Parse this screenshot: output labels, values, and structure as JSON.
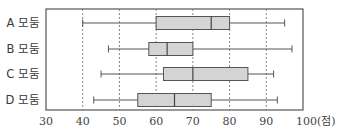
{
  "chart_data": {
    "type": "boxplot",
    "title": "",
    "xlabel": "",
    "ylabel": "",
    "unit_label": "(점)",
    "xlim": [
      30,
      100
    ],
    "x_ticks": [
      30,
      40,
      50,
      60,
      70,
      80,
      90,
      100
    ],
    "x_tick_labels": [
      "30",
      "40",
      "50",
      "60",
      "70",
      "80",
      "90",
      "100(점)"
    ],
    "gridlines": [
      40,
      50,
      60,
      70,
      80,
      90
    ],
    "grid": "vertical dashed",
    "legend": "none",
    "categories": [
      "A 모둠",
      "B 모둠",
      "C 모둠",
      "D 모둠"
    ],
    "series": [
      {
        "name": "A 모둠",
        "min": 40,
        "q1": 60,
        "median": 75,
        "q3": 80,
        "max": 95
      },
      {
        "name": "B 모둠",
        "min": 47,
        "q1": 58,
        "median": 63,
        "q3": 70,
        "max": 97
      },
      {
        "name": "C 모둠",
        "min": 45,
        "q1": 62,
        "median": 70,
        "q3": 85,
        "max": 92
      },
      {
        "name": "D 모둠",
        "min": 43,
        "q1": 55,
        "median": 65,
        "q3": 75,
        "max": 93
      }
    ],
    "colors": {
      "box_fill": "#d4d4d4",
      "stroke": "#555555",
      "grid": "#777777"
    }
  }
}
